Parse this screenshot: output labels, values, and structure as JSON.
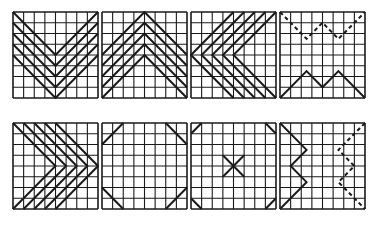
{
  "figure": {
    "grid_size": 8,
    "line_color": "#1a1a1a",
    "panels": [
      {
        "id": "v-chevrons",
        "x": 12,
        "y": 11,
        "solid": [
          [
            [
              0,
              0
            ],
            [
              4,
              4
            ],
            [
              8,
              0
            ]
          ],
          [
            [
              0,
              1
            ],
            [
              4,
              5
            ],
            [
              8,
              1
            ]
          ],
          [
            [
              0,
              2
            ],
            [
              4,
              6
            ],
            [
              8,
              2
            ]
          ],
          [
            [
              0,
              3
            ],
            [
              4,
              7
            ],
            [
              8,
              3
            ]
          ],
          [
            [
              0,
              4
            ],
            [
              4,
              8
            ],
            [
              8,
              4
            ]
          ]
        ],
        "dashed": []
      },
      {
        "id": "caret-chevrons",
        "x": 101,
        "y": 11,
        "solid": [
          [
            [
              0,
              4
            ],
            [
              4,
              0
            ],
            [
              8,
              4
            ]
          ],
          [
            [
              0,
              5
            ],
            [
              4,
              1
            ],
            [
              8,
              5
            ]
          ],
          [
            [
              0,
              6
            ],
            [
              4,
              2
            ],
            [
              8,
              6
            ]
          ],
          [
            [
              0,
              7
            ],
            [
              4,
              3
            ],
            [
              8,
              7
            ]
          ],
          [
            [
              0,
              8
            ],
            [
              4,
              4
            ],
            [
              8,
              8
            ]
          ]
        ],
        "dashed": []
      },
      {
        "id": "left-chevrons",
        "x": 190,
        "y": 11,
        "solid": [
          [
            [
              4,
              0
            ],
            [
              0,
              4
            ],
            [
              4,
              8
            ]
          ],
          [
            [
              5,
              0
            ],
            [
              1,
              4
            ],
            [
              5,
              8
            ]
          ],
          [
            [
              6,
              0
            ],
            [
              2,
              4
            ],
            [
              6,
              8
            ]
          ],
          [
            [
              7,
              0
            ],
            [
              3,
              4
            ],
            [
              7,
              8
            ]
          ],
          [
            [
              8,
              0
            ],
            [
              4,
              4
            ],
            [
              8,
              8
            ]
          ]
        ],
        "dashed": []
      },
      {
        "id": "zigzag-horizontal",
        "x": 279,
        "y": 11,
        "solid": [
          [
            [
              0,
              8
            ],
            [
              2.5,
              5.5
            ],
            [
              4,
              7
            ],
            [
              5.5,
              5.5
            ],
            [
              8,
              8
            ]
          ]
        ],
        "dashed": [
          [
            [
              0,
              0
            ],
            [
              2.5,
              2.5
            ],
            [
              4,
              1
            ],
            [
              5.5,
              2.5
            ],
            [
              8,
              0
            ]
          ]
        ]
      },
      {
        "id": "right-chevrons",
        "x": 12,
        "y": 122,
        "solid": [
          [
            [
              0,
              0
            ],
            [
              4,
              4
            ],
            [
              0,
              8
            ]
          ],
          [
            [
              1,
              0
            ],
            [
              5,
              4
            ],
            [
              1,
              8
            ]
          ],
          [
            [
              2,
              0
            ],
            [
              6,
              4
            ],
            [
              2,
              8
            ]
          ],
          [
            [
              3,
              0
            ],
            [
              7,
              4
            ],
            [
              3,
              8
            ]
          ],
          [
            [
              4,
              0
            ],
            [
              8,
              4
            ],
            [
              4,
              8
            ]
          ]
        ],
        "dashed": []
      },
      {
        "id": "corner-diagonals",
        "x": 101,
        "y": 122,
        "solid": [
          [
            [
              0,
              2
            ],
            [
              2,
              0
            ]
          ],
          [
            [
              6,
              0
            ],
            [
              8,
              2
            ]
          ],
          [
            [
              0,
              6
            ],
            [
              2,
              8
            ]
          ],
          [
            [
              6,
              8
            ],
            [
              8,
              6
            ]
          ]
        ],
        "dashed": []
      },
      {
        "id": "center-x",
        "x": 190,
        "y": 122,
        "solid": [
          [
            [
              0,
              1
            ],
            [
              1,
              0
            ]
          ],
          [
            [
              7,
              0
            ],
            [
              8,
              1
            ]
          ],
          [
            [
              0,
              7
            ],
            [
              1,
              8
            ]
          ],
          [
            [
              7,
              8
            ],
            [
              8,
              7
            ]
          ],
          [
            [
              3,
              3
            ],
            [
              5,
              5
            ]
          ],
          [
            [
              5,
              3
            ],
            [
              3,
              5
            ]
          ]
        ],
        "dashed": []
      },
      {
        "id": "zigzag-vertical",
        "x": 279,
        "y": 122,
        "solid": [
          [
            [
              0,
              0
            ],
            [
              2.5,
              2.5
            ],
            [
              1,
              4
            ],
            [
              2.5,
              5.5
            ],
            [
              0,
              8
            ]
          ]
        ],
        "dashed": [
          [
            [
              8,
              0
            ],
            [
              5.5,
              2.5
            ],
            [
              7,
              4
            ],
            [
              5.5,
              5.5
            ],
            [
              8,
              8
            ]
          ]
        ]
      }
    ]
  }
}
